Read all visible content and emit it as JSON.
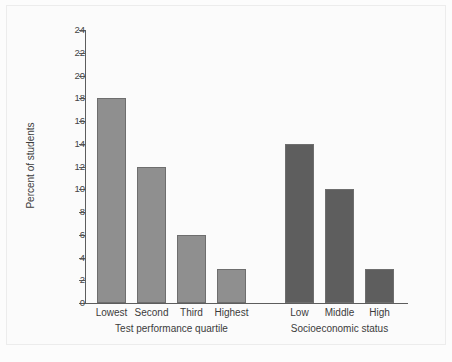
{
  "chart_data": {
    "type": "bar",
    "title": "",
    "subtitle": "",
    "xlabel": "",
    "ylabel": "Percent of students",
    "ylim": [
      0,
      24
    ],
    "ytick_step": 2,
    "yticks": [
      "24",
      "22",
      "20",
      "18",
      "16",
      "14",
      "12",
      "10",
      "8",
      "6",
      "4",
      "2",
      "0"
    ],
    "grid": false,
    "legend": "none",
    "groups": [
      {
        "name": "Test performance quartile",
        "color": "#8f8f8f",
        "categories": [
          "Lowest",
          "Second",
          "Third",
          "Highest"
        ],
        "values": [
          18,
          12,
          6,
          3
        ]
      },
      {
        "name": "Socioeconomic status",
        "color": "#5e5e5e",
        "categories": [
          "Low",
          "Middle",
          "High"
        ],
        "values": [
          14,
          10,
          3
        ]
      }
    ],
    "axis_color": "#5d5d5d",
    "bar_border_color": "#6e6e6e",
    "background_color": "#fbfbfb"
  }
}
